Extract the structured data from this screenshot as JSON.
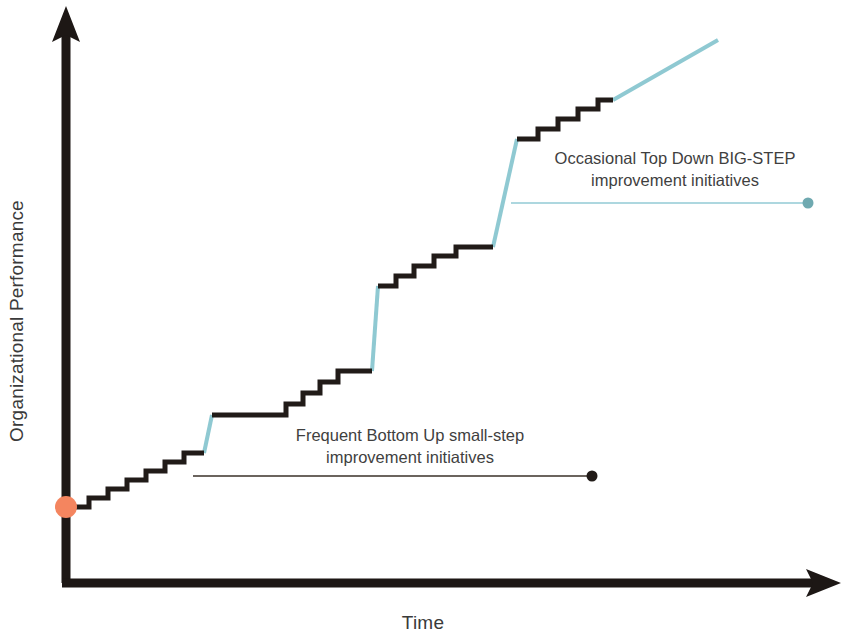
{
  "figure": {
    "kind": "continuous-improvement-staircase",
    "background_color": "#ffffff"
  },
  "axes": {
    "y_label": "Organizational Performance",
    "x_label": "Time",
    "axis_color": "#1d1715",
    "y_axis_arrow": "up-arrow-icon",
    "x_axis_arrow": "right-arrow-icon"
  },
  "annotations": {
    "top": {
      "line1": "Occasional Top Down BIG-STEP",
      "line2": "improvement initiatives",
      "leader_color": "#92cad4",
      "endpoint_marker": "teal-dot-marker"
    },
    "bottom": {
      "line1": "Frequent Bottom Up small-step",
      "line2": "improvement initiatives",
      "leader_color": "#3a3028",
      "endpoint_marker": "black-dot-marker"
    }
  },
  "markers": {
    "origin_dot": {
      "name": "start-point-dot",
      "color": "#f4855f",
      "cx": 66,
      "cy": 507,
      "r": 11
    },
    "bottom_leader_dot": {
      "name": "bottom-leader-endpoint-dot",
      "color": "#211b18",
      "cx": 592,
      "cy": 476,
      "r": 5.5
    },
    "top_leader_dot": {
      "name": "top-leader-endpoint-dot",
      "color": "#6fa9b0",
      "cx": 808,
      "cy": 203,
      "r": 5.5
    }
  },
  "chart_data": {
    "type": "line",
    "title": "",
    "xlabel": "Time",
    "ylabel": "Organizational Performance",
    "grid": false,
    "legend": null,
    "xlim": [
      60,
      846
    ],
    "ylim": [
      0,
      642
    ],
    "series": [
      {
        "name": "small-step staircase (bottom-up)",
        "color": "#211b18",
        "width": 5,
        "segments": [
          {
            "id": "seg-1",
            "points": "66,507 89,507 89,498 108,498 108,489 127,489 127,480 146,480 146,471 165,471 165,462 184,462 184,453 204,453"
          },
          {
            "id": "seg-2",
            "points": "212,415 286,415 286,404 303,404 303,393 320,393 320,382 338,382 338,371 372,371"
          },
          {
            "id": "seg-3",
            "points": "378,286 396,286 396,276 414,276 414,266 434,266 434,256 456,256 456,247 493,247"
          },
          {
            "id": "seg-4",
            "points": "517,139 538,139 538,129 558,129 558,119 578,119 578,109 598,109 598,100 613,100"
          }
        ]
      },
      {
        "name": "BIG-STEP risers (top-down)",
        "color": "#8fc9d2",
        "width": 4,
        "segments": [
          {
            "id": "riser-1",
            "points": "204,453 212,415"
          },
          {
            "id": "riser-2",
            "points": "372,371 378,286"
          },
          {
            "id": "riser-3",
            "points": "493,247 517,139"
          },
          {
            "id": "riser-4-ramp",
            "points": "613,100 718,40"
          }
        ]
      }
    ],
    "small_step_counts": {
      "before_first_big_step": 7,
      "between_first_and_second": 4,
      "between_second_and_third": 5,
      "after_third": 4
    },
    "big_step_count": 3
  },
  "leader_lines": {
    "bottom": {
      "x1": 193,
      "y1": 476,
      "x2": 590,
      "y2": 476,
      "color": "#3a3028",
      "width": 1.6
    },
    "top": {
      "x1": 511,
      "y1": 203,
      "x2": 806,
      "y2": 203,
      "color": "#92cad4",
      "width": 1.6
    }
  }
}
